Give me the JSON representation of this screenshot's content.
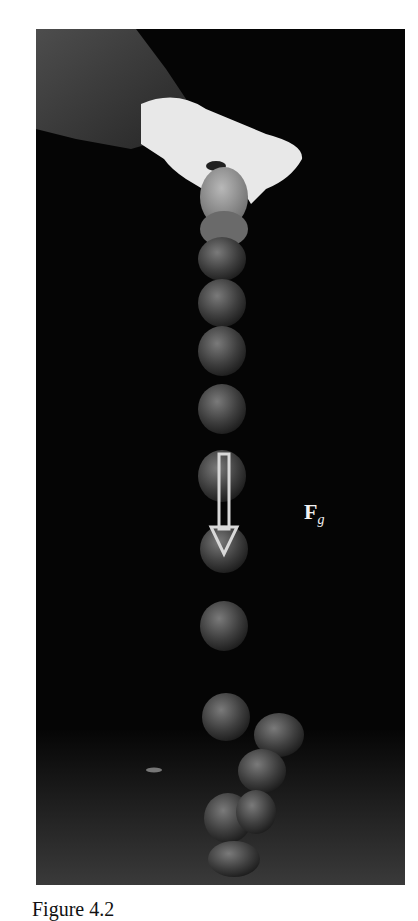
{
  "figure": {
    "force_label": "F",
    "force_subscript": "g",
    "caption": "Figure 4.2"
  }
}
